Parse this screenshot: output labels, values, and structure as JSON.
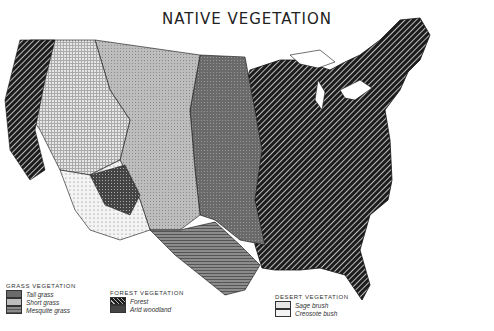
{
  "title": "NATIVE VEGETATION",
  "legend": {
    "grass": {
      "heading": "GRASS VEGETATION",
      "items": [
        {
          "label": "Tall grass",
          "pattern": "tall"
        },
        {
          "label": "Short grass",
          "pattern": "short"
        },
        {
          "label": "Mesquite grass",
          "pattern": "mesquite"
        }
      ]
    },
    "forest": {
      "heading": "FOREST VEGETATION",
      "items": [
        {
          "label": "Forest",
          "pattern": "forest"
        },
        {
          "label": "Arid woodland",
          "pattern": "arid"
        }
      ]
    },
    "desert": {
      "heading": "DESERT VEGETATION",
      "items": [
        {
          "label": "Sage brush",
          "pattern": "sage"
        },
        {
          "label": "Creosote bush",
          "pattern": "creosote"
        }
      ]
    }
  }
}
